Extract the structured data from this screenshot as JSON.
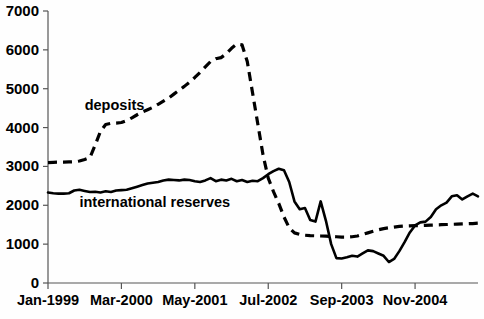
{
  "chart_data": {
    "type": "line",
    "title": "",
    "subtitle": "",
    "xlabel": "",
    "ylabel": "",
    "grid": false,
    "legend_position": "inline-annotations",
    "ylim": [
      0,
      7000
    ],
    "ytick_labels": [
      "0",
      "1000",
      "2000",
      "3000",
      "4000",
      "5000",
      "6000",
      "7000"
    ],
    "ytick_values": [
      0,
      1000,
      2000,
      3000,
      4000,
      5000,
      6000,
      7000
    ],
    "xtick_labels": [
      "Jan-1999",
      "Mar-2000",
      "May-2001",
      "Jul-2002",
      "Sep-2003",
      "Nov-2004"
    ],
    "xtick_index": [
      0,
      14,
      28,
      42,
      56,
      70
    ],
    "x_count": 83,
    "annotations": [
      {
        "text": "deposits",
        "x_index": 7,
        "y_value": 4450
      },
      {
        "text": "international reserves",
        "x_index": 6,
        "y_value": 1950
      }
    ],
    "series": [
      {
        "name": "deposits",
        "style": "dashed",
        "values": [
          3100,
          3105,
          3110,
          3110,
          3115,
          3120,
          3140,
          3180,
          3230,
          3550,
          3900,
          4080,
          4110,
          4115,
          4130,
          4180,
          4250,
          4330,
          4400,
          4460,
          4520,
          4600,
          4680,
          4760,
          4860,
          4960,
          5060,
          5170,
          5290,
          5420,
          5560,
          5700,
          5770,
          5800,
          5900,
          6040,
          6150,
          6130,
          5700,
          4900,
          4100,
          3300,
          2700,
          2350,
          2050,
          1700,
          1420,
          1290,
          1250,
          1230,
          1220,
          1215,
          1210,
          1205,
          1200,
          1190,
          1180,
          1180,
          1190,
          1210,
          1250,
          1290,
          1330,
          1370,
          1400,
          1420,
          1440,
          1455,
          1465,
          1470,
          1475,
          1480,
          1485,
          1490,
          1495,
          1500,
          1505,
          1510,
          1515,
          1520,
          1525,
          1530,
          1540
        ]
      },
      {
        "name": "international reserves",
        "style": "solid",
        "values": [
          2330,
          2310,
          2300,
          2300,
          2310,
          2380,
          2400,
          2370,
          2340,
          2350,
          2330,
          2360,
          2340,
          2380,
          2390,
          2400,
          2440,
          2480,
          2520,
          2560,
          2580,
          2600,
          2640,
          2660,
          2650,
          2640,
          2660,
          2650,
          2620,
          2600,
          2640,
          2700,
          2620,
          2660,
          2640,
          2680,
          2620,
          2650,
          2600,
          2630,
          2620,
          2700,
          2800,
          2880,
          2940,
          2900,
          2600,
          2100,
          1900,
          1930,
          1620,
          1580,
          2100,
          1600,
          1000,
          640,
          630,
          660,
          700,
          680,
          760,
          840,
          820,
          760,
          700,
          540,
          620,
          820,
          1050,
          1300,
          1480,
          1560,
          1580,
          1700,
          1900,
          2000,
          2070,
          2230,
          2260,
          2150,
          2230,
          2300,
          2230
        ]
      }
    ]
  },
  "axes": {
    "y_axis_name": "y-axis",
    "x_axis_name": "x-axis"
  },
  "colors": {
    "background": "#ffffff",
    "line": "#000000",
    "axis": "#555555",
    "text": "#000000"
  }
}
